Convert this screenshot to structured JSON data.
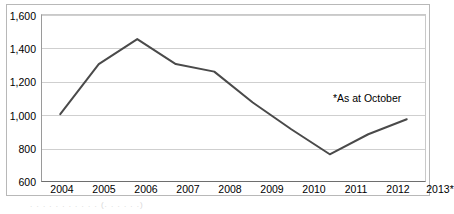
{
  "chart_data": {
    "type": "line",
    "title": "",
    "xlabel": "",
    "ylabel": "",
    "categories": [
      "2004",
      "2005",
      "2006",
      "2007",
      "2008",
      "2009",
      "2010",
      "2011",
      "2012",
      "2013*"
    ],
    "values": [
      1000,
      1300,
      1450,
      1300,
      1255,
      1070,
      910,
      760,
      880,
      970
    ],
    "ylim": [
      600,
      1600
    ],
    "yticks": [
      600,
      800,
      1000,
      1200,
      1400,
      1600
    ],
    "ytick_labels": [
      "600",
      "800",
      "1,000",
      "1,200",
      "1,400",
      "1,600"
    ],
    "grid": true,
    "legend": false,
    "annotations": [
      "*As at October"
    ],
    "series": [
      {
        "name": "",
        "values": [
          1000,
          1300,
          1450,
          1300,
          1255,
          1070,
          910,
          760,
          880,
          970
        ]
      }
    ]
  },
  "axis": {
    "y_tick_labels": [
      "1,600",
      "1,400",
      "1,200",
      "1,000",
      "800",
      "600"
    ],
    "x_tick_labels": [
      "2004",
      "2005",
      "2006",
      "2007",
      "2008",
      "2009",
      "2010",
      "2011",
      "2012",
      "2013*"
    ]
  },
  "annotation": {
    "footnote": "*As at October"
  },
  "colors": {
    "series_line": "#4a4a4a",
    "gridline": "#cfcfcf",
    "frame": "#b8b8b8",
    "axis": "#6e6e6e",
    "text": "#000000",
    "background": "#ffffff"
  }
}
